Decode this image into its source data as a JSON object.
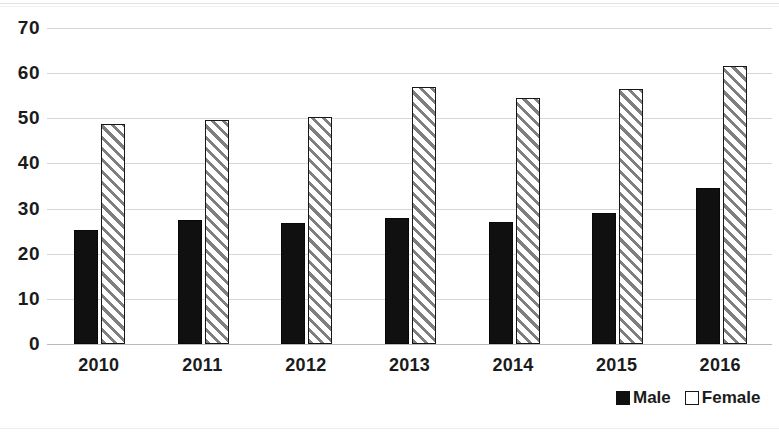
{
  "chart_data": {
    "type": "bar",
    "title": "",
    "subtitle": "",
    "xlabel": "",
    "ylabel": "",
    "categories": [
      "2010",
      "2011",
      "2012",
      "2013",
      "2014",
      "2015",
      "2016"
    ],
    "series": [
      {
        "name": "Male",
        "color": "#101010",
        "values": [
          25.2,
          27.5,
          26.8,
          27.9,
          27.1,
          29.0,
          34.5
        ]
      },
      {
        "name": "Female",
        "color": "#ffffff",
        "pattern": "diagonal-hatch",
        "values": [
          48.7,
          49.6,
          50.3,
          57.0,
          54.4,
          56.4,
          61.5
        ]
      }
    ],
    "ylim": [
      0,
      70
    ],
    "ytick_step": 10,
    "ytick_labels": [
      "70",
      "60",
      "50",
      "40",
      "30",
      "20",
      "10",
      "0"
    ],
    "grid": true,
    "grid_axis": "y",
    "legend_position": "bottom-right",
    "legend_entries": [
      "Male",
      "Female"
    ]
  }
}
